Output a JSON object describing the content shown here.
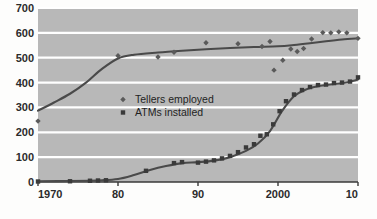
{
  "chart_data": {
    "type": "scatter",
    "title": "",
    "subtitle": "",
    "xlabel": "",
    "ylabel": "",
    "xlim": [
      1970,
      2010
    ],
    "ylim": [
      0,
      700
    ],
    "xticks": [
      1970,
      1980,
      1990,
      2000,
      2010
    ],
    "xticklabels": [
      "1970",
      "80",
      "90",
      "2000",
      "10"
    ],
    "yticks": [
      0,
      100,
      200,
      300,
      400,
      500,
      600,
      700
    ],
    "yticklabels": [
      "0",
      "100",
      "200",
      "300",
      "400",
      "500",
      "600",
      "700"
    ],
    "grid": "horizontal",
    "legend_position": "center-left",
    "plot_background": "#b8b8b8",
    "gridline_color": "#ffffff",
    "trend_color": "#4a4a4a",
    "series": [
      {
        "name": "Tellers employed",
        "marker": "diamond",
        "color": "#5a5a5a",
        "points": [
          {
            "x": 1970,
            "y": 245
          },
          {
            "x": 1985,
            "y": 503
          },
          {
            "x": 1987,
            "y": 522
          },
          {
            "x": 1991,
            "y": 560
          },
          {
            "x": 1995,
            "y": 556
          },
          {
            "x": 1998,
            "y": 545
          },
          {
            "x": 1999,
            "y": 565
          },
          {
            "x": 1999.5,
            "y": 450
          },
          {
            "x": 2000.6,
            "y": 490
          },
          {
            "x": 2001.6,
            "y": 535
          },
          {
            "x": 2002.4,
            "y": 525
          },
          {
            "x": 2003.2,
            "y": 537
          },
          {
            "x": 2004.2,
            "y": 575
          },
          {
            "x": 2005.6,
            "y": 601
          },
          {
            "x": 2006.6,
            "y": 600
          },
          {
            "x": 2007.6,
            "y": 604
          },
          {
            "x": 2008.6,
            "y": 600
          },
          {
            "x": 2010,
            "y": 578
          },
          {
            "x": 1980,
            "y": 508
          }
        ],
        "trend": [
          {
            "x": 1970,
            "y": 287
          },
          {
            "x": 1972,
            "y": 320
          },
          {
            "x": 1974,
            "y": 355
          },
          {
            "x": 1976,
            "y": 400
          },
          {
            "x": 1978,
            "y": 455
          },
          {
            "x": 1980,
            "y": 497
          },
          {
            "x": 1982,
            "y": 512
          },
          {
            "x": 1985,
            "y": 521
          },
          {
            "x": 1988,
            "y": 528
          },
          {
            "x": 1991,
            "y": 534
          },
          {
            "x": 1994,
            "y": 539
          },
          {
            "x": 1997,
            "y": 543
          },
          {
            "x": 2000,
            "y": 546
          },
          {
            "x": 2002,
            "y": 551
          },
          {
            "x": 2004,
            "y": 558
          },
          {
            "x": 2006,
            "y": 566
          },
          {
            "x": 2008,
            "y": 573
          },
          {
            "x": 2010,
            "y": 578
          }
        ]
      },
      {
        "name": "ATMs installed",
        "marker": "square",
        "color": "#3a3a3a",
        "points": [
          {
            "x": 1970,
            "y": 2
          },
          {
            "x": 1974,
            "y": 3
          },
          {
            "x": 1976.5,
            "y": 5
          },
          {
            "x": 1977.5,
            "y": 6
          },
          {
            "x": 1978.5,
            "y": 7
          },
          {
            "x": 1983.5,
            "y": 45
          },
          {
            "x": 1987,
            "y": 76
          },
          {
            "x": 1988,
            "y": 80
          },
          {
            "x": 1990,
            "y": 78
          },
          {
            "x": 1991,
            "y": 82
          },
          {
            "x": 1992,
            "y": 87
          },
          {
            "x": 1993,
            "y": 95
          },
          {
            "x": 1994,
            "y": 105
          },
          {
            "x": 1995,
            "y": 120
          },
          {
            "x": 1996,
            "y": 139
          },
          {
            "x": 1997,
            "y": 152
          },
          {
            "x": 1997.8,
            "y": 186
          },
          {
            "x": 1998.6,
            "y": 192
          },
          {
            "x": 1999.4,
            "y": 232
          },
          {
            "x": 2000.2,
            "y": 285
          },
          {
            "x": 2001,
            "y": 325
          },
          {
            "x": 2002,
            "y": 352
          },
          {
            "x": 2003,
            "y": 370
          },
          {
            "x": 2004,
            "y": 382
          },
          {
            "x": 2005,
            "y": 390
          },
          {
            "x": 2006,
            "y": 392
          },
          {
            "x": 2007,
            "y": 398
          },
          {
            "x": 2008,
            "y": 400
          },
          {
            "x": 2009,
            "y": 404
          },
          {
            "x": 2010,
            "y": 421
          }
        ],
        "trend": [
          {
            "x": 1970,
            "y": 3
          },
          {
            "x": 1974,
            "y": 4
          },
          {
            "x": 1978,
            "y": 7
          },
          {
            "x": 1980,
            "y": 12
          },
          {
            "x": 1982,
            "y": 28
          },
          {
            "x": 1984,
            "y": 48
          },
          {
            "x": 1986,
            "y": 64
          },
          {
            "x": 1988,
            "y": 76
          },
          {
            "x": 1990,
            "y": 80
          },
          {
            "x": 1992,
            "y": 86
          },
          {
            "x": 1994,
            "y": 100
          },
          {
            "x": 1996,
            "y": 125
          },
          {
            "x": 1997.5,
            "y": 155
          },
          {
            "x": 1999,
            "y": 205
          },
          {
            "x": 2000.5,
            "y": 285
          },
          {
            "x": 2002,
            "y": 345
          },
          {
            "x": 2003.5,
            "y": 372
          },
          {
            "x": 2005,
            "y": 385
          },
          {
            "x": 2007,
            "y": 394
          },
          {
            "x": 2008.5,
            "y": 400
          },
          {
            "x": 2010,
            "y": 412
          }
        ]
      }
    ]
  },
  "legend": {
    "items": [
      {
        "label": "Tellers employed",
        "marker": "diamond"
      },
      {
        "label": "ATMs installed",
        "marker": "square"
      }
    ]
  }
}
